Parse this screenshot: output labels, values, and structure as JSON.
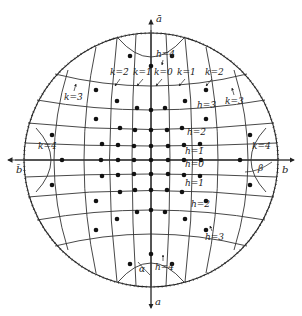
{
  "diagram": {
    "type": "hyperbolic coordinate net in disk (Poincaré-style)",
    "axes": {
      "top": "ā",
      "bottom": "a",
      "left": "b̄",
      "right": "b"
    },
    "angles": {
      "alpha": "α",
      "beta": "β"
    },
    "k_labels": {
      "k_m4": "k=4̄",
      "k_m3": "k=3̄",
      "k_m2": "k=2̄",
      "k_m1": "k=1̄",
      "k_0": "k=0",
      "k_1": "k=1",
      "k_2": "k=2",
      "k_3": "k=3",
      "k_4": "k=4"
    },
    "h_labels": {
      "h_m4": "h=4",
      "h_m3": "h=3̄",
      "h_m2": "h=2̄",
      "h_m1": "h=1̄",
      "h_0": "h=0",
      "h_1": "h=1",
      "h_2": "h=2",
      "h_3": "h=3",
      "h_4": "h=4"
    },
    "colors": {
      "ink": "#222222",
      "background": "#ffffff"
    }
  }
}
